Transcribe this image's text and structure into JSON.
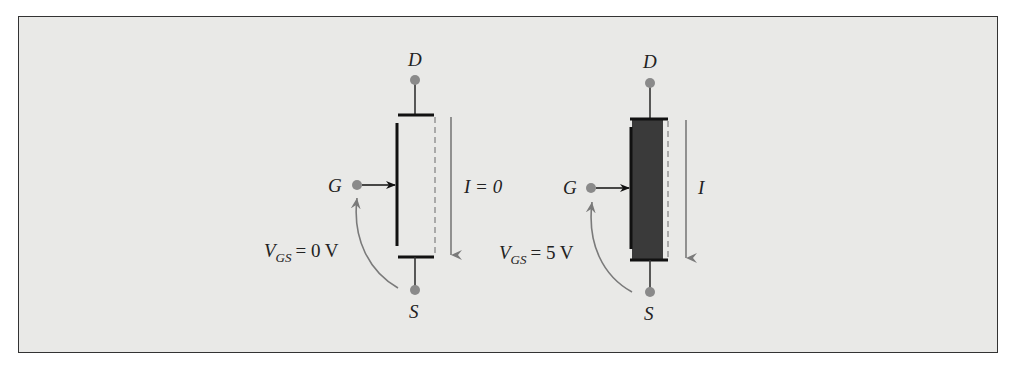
{
  "figure": {
    "background": "#e9e9e7",
    "border_color": "#333333",
    "terminal_color": "#8a8a8a",
    "channel_fill": "#3a3a3a",
    "arrow_color": "#7a7a7a"
  },
  "left_transistor": {
    "state": "off",
    "drain_label": "D",
    "source_label": "S",
    "gate_label": "G",
    "current_label": "I = 0",
    "vgs_label_main": "V",
    "vgs_label_sub": "GS",
    "vgs_label_value": "= 0 V"
  },
  "right_transistor": {
    "state": "on",
    "drain_label": "D",
    "source_label": "S",
    "gate_label": "G",
    "current_label": "I",
    "vgs_label_main": "V",
    "vgs_label_sub": "GS",
    "vgs_label_value": "= 5 V"
  }
}
